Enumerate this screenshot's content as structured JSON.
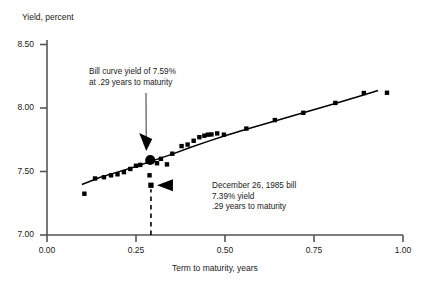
{
  "chart_data": {
    "type": "scatter",
    "title": "",
    "xlabel": "Term to maturity, years",
    "ylabel": "Yield, percent",
    "xlim": [
      0.0,
      1.0
    ],
    "ylim": [
      7.0,
      8.5
    ],
    "xticks": [
      "0.00",
      "0.25",
      "0.50",
      "0.75",
      "1.00"
    ],
    "xtick_values": [
      0.0,
      0.25,
      0.5,
      0.75,
      1.0
    ],
    "yticks": [
      "7.00",
      "7.50",
      "8.00",
      "8.50"
    ],
    "ytick_values": [
      7.0,
      7.5,
      8.0,
      8.5
    ],
    "grid": false,
    "legend": "none",
    "series": [
      {
        "name": "Treasury bill yields",
        "type": "scatter",
        "marker": "square",
        "color": "#000000",
        "points": [
          [
            0.105,
            7.325
          ],
          [
            0.135,
            7.445
          ],
          [
            0.16,
            7.455
          ],
          [
            0.18,
            7.47
          ],
          [
            0.198,
            7.478
          ],
          [
            0.216,
            7.495
          ],
          [
            0.234,
            7.52
          ],
          [
            0.25,
            7.545
          ],
          [
            0.262,
            7.552
          ],
          [
            0.283,
            7.578
          ],
          [
            0.288,
            7.47
          ],
          [
            0.292,
            7.392
          ],
          [
            0.309,
            7.565
          ],
          [
            0.32,
            7.6
          ],
          [
            0.337,
            7.556
          ],
          [
            0.352,
            7.64
          ],
          [
            0.378,
            7.7
          ],
          [
            0.395,
            7.712
          ],
          [
            0.412,
            7.742
          ],
          [
            0.428,
            7.77
          ],
          [
            0.442,
            7.782
          ],
          [
            0.452,
            7.79
          ],
          [
            0.462,
            7.792
          ],
          [
            0.478,
            7.8
          ],
          [
            0.497,
            7.79
          ],
          [
            0.56,
            7.838
          ],
          [
            0.64,
            7.905
          ],
          [
            0.72,
            7.962
          ],
          [
            0.81,
            8.04
          ],
          [
            0.89,
            8.118
          ],
          [
            0.955,
            8.12
          ]
        ]
      },
      {
        "name": "Fitted bill yield curve",
        "type": "line",
        "color": "#000000",
        "points": [
          [
            0.098,
            7.398
          ],
          [
            0.15,
            7.455
          ],
          [
            0.2,
            7.497
          ],
          [
            0.25,
            7.54
          ],
          [
            0.29,
            7.578
          ],
          [
            0.35,
            7.635
          ],
          [
            0.4,
            7.687
          ],
          [
            0.45,
            7.735
          ],
          [
            0.5,
            7.782
          ],
          [
            0.56,
            7.832
          ],
          [
            0.64,
            7.898
          ],
          [
            0.72,
            7.962
          ],
          [
            0.8,
            8.028
          ],
          [
            0.88,
            8.095
          ],
          [
            0.93,
            8.138
          ]
        ]
      }
    ],
    "highlighted_points": [
      {
        "name": "bill-curve-yield-point",
        "x": 0.29,
        "y": 7.59,
        "marker": "circle",
        "color": "#000000"
      },
      {
        "name": "december-bill-point",
        "x": 0.292,
        "y": 7.392,
        "marker": "square",
        "color": "#000000"
      }
    ],
    "annotations": [
      {
        "name": "bill-curve-annotation",
        "lines": [
          "Bill curve yield of 7.59%",
          "at .29 years to maturity"
        ],
        "target_x": 0.29,
        "target_y": 7.59
      },
      {
        "name": "december-bill-annotation",
        "lines": [
          "December 26, 1985 bill",
          "7.39% yield",
          ".29 years to maturity"
        ],
        "target_x": 0.292,
        "target_y": 7.392
      }
    ],
    "reference_line": {
      "name": "maturity-reference-line",
      "style": "dashed",
      "x": 0.292,
      "y_from": 7.0,
      "y_to": 7.392
    }
  }
}
